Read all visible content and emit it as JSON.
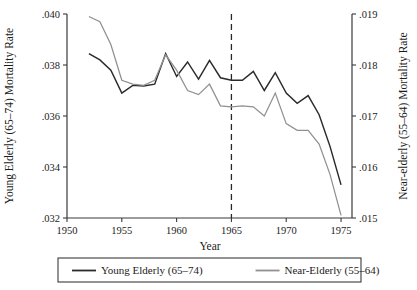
{
  "chart_data": {
    "type": "line",
    "title": "",
    "xlabel": "Year",
    "ylabel": "Young Elderly (65–74) Mortality Rate",
    "ylabel_right": "Near-elderly (55–64) Mortality Rate",
    "xlim": [
      1950,
      1976
    ],
    "ylim": [
      0.032,
      0.04
    ],
    "ylim_right": [
      0.015,
      0.019
    ],
    "xticks": [
      1950,
      1955,
      1960,
      1965,
      1970,
      1975
    ],
    "xticklabels": [
      "1950",
      "1955",
      "1960",
      "1965",
      "1970",
      "1975"
    ],
    "yticks": [
      0.032,
      0.034,
      0.036,
      0.038,
      0.04
    ],
    "yticklabels": [
      ".032",
      ".034",
      ".036",
      ".038",
      ".040"
    ],
    "yticks_right": [
      0.015,
      0.016,
      0.017,
      0.018,
      0.019
    ],
    "yticklabels_right": [
      ".015",
      ".016",
      ".017",
      ".018",
      ".019"
    ],
    "grid": false,
    "legend_position": "bottom",
    "annotations": [
      {
        "name": "medicare-reference-line",
        "type": "vline",
        "x": 1965,
        "style": "dashed"
      }
    ],
    "x": [
      1952,
      1953,
      1954,
      1955,
      1956,
      1957,
      1958,
      1959,
      1960,
      1961,
      1962,
      1963,
      1964,
      1965,
      1966,
      1967,
      1968,
      1969,
      1970,
      1971,
      1972,
      1973,
      1974,
      1975
    ],
    "series": [
      {
        "name": "Young Elderly (65–74)",
        "axis": "left",
        "color": "#2a2a2a",
        "values": [
          0.03845,
          0.0382,
          0.0378,
          0.0369,
          0.0372,
          0.03718,
          0.03725,
          0.03845,
          0.03755,
          0.03812,
          0.03745,
          0.03818,
          0.0375,
          0.0374,
          0.0374,
          0.03775,
          0.037,
          0.0377,
          0.0369,
          0.0365,
          0.0368,
          0.03605,
          0.0348,
          0.0333
        ]
      },
      {
        "name": "Near-Elderly (55–64)",
        "axis": "right",
        "color": "#909090",
        "values": [
          0.01895,
          0.01885,
          0.0184,
          0.0177,
          0.017625,
          0.0176,
          0.0177,
          0.0182,
          0.0179,
          0.0175,
          0.01742,
          0.017625,
          0.0172,
          0.01718,
          0.0172,
          0.01718,
          0.017,
          0.01745,
          0.01685,
          0.01672,
          0.01672,
          0.01645,
          0.01585,
          0.01505
        ]
      }
    ],
    "legend": [
      {
        "label": "Young Elderly (65–74)",
        "color": "#2a2a2a"
      },
      {
        "label": "Near-Elderly (55–64)",
        "color": "#909090"
      }
    ]
  }
}
